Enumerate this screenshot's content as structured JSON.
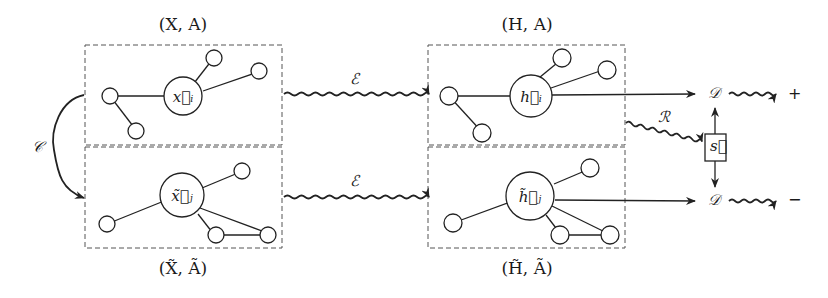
{
  "diagram": {
    "colors": {
      "stroke": "#222222",
      "dash": "#555555",
      "background": "#ffffff"
    },
    "panels": [
      {
        "id": "input-original",
        "title": "(X, A)",
        "center_node": "x⃗ᵢ"
      },
      {
        "id": "input-corrupted",
        "title": "(X̃, Ã)",
        "center_node": "x̃⃗ⱼ"
      },
      {
        "id": "embed-original",
        "title": "(H, A)",
        "center_node": "h⃗ᵢ"
      },
      {
        "id": "embed-corrupted",
        "title": "(H̃, Ã)",
        "center_node": "h̃⃗ⱼ"
      }
    ],
    "operators": {
      "corruption": "𝒞",
      "encoder_top": "ℰ",
      "encoder_bottom": "ℰ",
      "readout": "ℛ",
      "discriminator_top": "𝒟",
      "discriminator_bottom": "𝒟",
      "summary": "s⃗"
    },
    "outputs": {
      "positive": "+",
      "negative": "−"
    }
  }
}
